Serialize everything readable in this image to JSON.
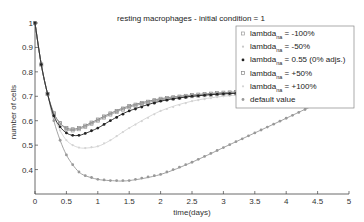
{
  "chart_data": {
    "type": "line",
    "title": "resting macrophages - initial condition = 1",
    "xlabel": "time(days)",
    "ylabel": "number of cells",
    "xlim": [
      0,
      5
    ],
    "ylim": [
      0.3,
      1
    ],
    "xticks": [
      "0",
      "0.5",
      "1",
      "1.5",
      "2",
      "2.5",
      "3",
      "3.5",
      "4",
      "4.5",
      "5"
    ],
    "yticks": [
      "0.4",
      "0.5",
      "0.6",
      "0.7",
      "0.8",
      "0.9",
      "1"
    ],
    "grid": false,
    "legend_position": "upper right (inside)",
    "x": [
      0,
      0.1,
      0.2,
      0.3,
      0.4,
      0.5,
      0.6,
      0.7,
      0.8,
      1.0,
      1.2,
      1.5,
      2.0,
      2.5,
      3.0,
      3.5,
      4.0,
      4.5,
      5.0
    ],
    "series": [
      {
        "name": "lambda_na = -100%",
        "marker": "square-open",
        "color": "#9a9a9a",
        "values": [
          1,
          0.83,
          0.71,
          0.63,
          0.59,
          0.565,
          0.56,
          0.565,
          0.575,
          0.6,
          0.625,
          0.655,
          0.685,
          0.7,
          0.71,
          0.715,
          0.72,
          0.725,
          0.73
        ]
      },
      {
        "name": "lambda_na = -50%",
        "marker": "dot",
        "color": "#c8c8c8",
        "values": [
          1,
          0.83,
          0.71,
          0.63,
          0.59,
          0.57,
          0.565,
          0.57,
          0.58,
          0.605,
          0.63,
          0.66,
          0.69,
          0.705,
          0.715,
          0.72,
          0.725,
          0.73,
          0.735
        ]
      },
      {
        "name": "lambda_na = 0.55 (0% adjs.)",
        "marker": "star",
        "color": "#222222",
        "values": [
          1,
          0.83,
          0.71,
          0.62,
          0.575,
          0.55,
          0.54,
          0.54,
          0.548,
          0.57,
          0.6,
          0.64,
          0.68,
          0.7,
          0.71,
          0.715,
          0.72,
          0.725,
          0.73
        ]
      },
      {
        "name": "lambda_na = +50%",
        "marker": "square-open",
        "color": "#888888",
        "values": [
          1,
          0.83,
          0.71,
          0.63,
          0.59,
          0.57,
          0.565,
          0.57,
          0.58,
          0.605,
          0.63,
          0.66,
          0.69,
          0.705,
          0.715,
          0.72,
          0.725,
          0.73,
          0.735
        ]
      },
      {
        "name": "lambda_na = +100%",
        "marker": "dot",
        "color": "#d4d4d4",
        "values": [
          1,
          0.83,
          0.71,
          0.62,
          0.56,
          0.52,
          0.5,
          0.49,
          0.488,
          0.495,
          0.52,
          0.57,
          0.64,
          0.68,
          0.7,
          0.71,
          0.715,
          0.72,
          0.725
        ]
      },
      {
        "name": "default value",
        "marker": "star",
        "color": "#999999",
        "values": [
          1,
          0.83,
          0.71,
          0.6,
          0.52,
          0.46,
          0.42,
          0.39,
          0.375,
          0.36,
          0.355,
          0.355,
          0.38,
          0.43,
          0.49,
          0.55,
          0.61,
          0.67,
          0.72
        ]
      }
    ]
  },
  "legend": {
    "items": [
      {
        "base": "lambda",
        "sub": "na",
        "rest": " = -100%"
      },
      {
        "base": "lambda",
        "sub": "na",
        "rest": " = -50%"
      },
      {
        "base": "lambda",
        "sub": "na",
        "rest": " = 0.55 (0% adjs.)"
      },
      {
        "base": "lambda",
        "sub": "na",
        "rest": " = +50%"
      },
      {
        "base": "lambda",
        "sub": "na",
        "rest": " = +100%"
      },
      {
        "base": "",
        "sub": "",
        "rest": "default value"
      }
    ]
  }
}
